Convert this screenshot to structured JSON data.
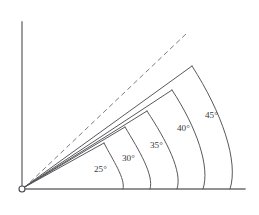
{
  "figure": {
    "background_color": "#ffffff",
    "line_color": "#58585c",
    "axis_color": "#6e6e70"
  },
  "axes": {
    "origin": {
      "x": 22,
      "y": 189,
      "marker": "open-circle",
      "radius": 3.0
    },
    "vertical": {
      "x": 22,
      "y_top": 22,
      "y_bottom": 189
    },
    "horizontal": {
      "y": 189,
      "x_left": 22,
      "x_right": 245
    }
  },
  "chart_data": {
    "type": "line",
    "xlabel": "",
    "ylabel": "",
    "grid": false,
    "legend": "none",
    "categories": [
      "25°",
      "30°",
      "35°",
      "40°",
      "45°"
    ],
    "values": [
      25,
      30,
      35,
      40,
      45
    ],
    "series": [
      {
        "name": "rays",
        "units": "degrees",
        "points": [
          {
            "label": "25°",
            "angle_deg": 25,
            "style": "solid",
            "end_x": 104,
            "end_y": 143,
            "axis_foot_x": 123,
            "label_x": 94,
            "label_y": 172
          },
          {
            "label": "30°",
            "angle_deg": 30,
            "style": "solid",
            "end_x": 125,
            "end_y": 127,
            "axis_foot_x": 150,
            "label_x": 122,
            "label_y": 161
          },
          {
            "label": "35°",
            "angle_deg": 35,
            "style": "solid",
            "end_x": 147,
            "end_y": 111,
            "axis_foot_x": 177,
            "label_x": 150,
            "label_y": 148
          },
          {
            "label": "40°",
            "angle_deg": 40,
            "style": "solid",
            "end_x": 172,
            "end_y": 90,
            "axis_foot_x": 203,
            "label_x": 177,
            "label_y": 131
          },
          {
            "label": "45°",
            "angle_deg": 45,
            "style": "solid",
            "end_x": 192,
            "end_y": 66,
            "axis_foot_x": 230,
            "label_x": 205,
            "label_y": 118
          }
        ]
      },
      {
        "name": "reference-ray",
        "units": "degrees",
        "style": "dashed",
        "points": [
          {
            "label": "",
            "angle_deg": 50,
            "style": "dashed",
            "end_x": 187,
            "end_y": 33
          }
        ]
      }
    ],
    "xlim": [
      0,
      259
    ],
    "ylim": [
      0,
      215
    ]
  }
}
